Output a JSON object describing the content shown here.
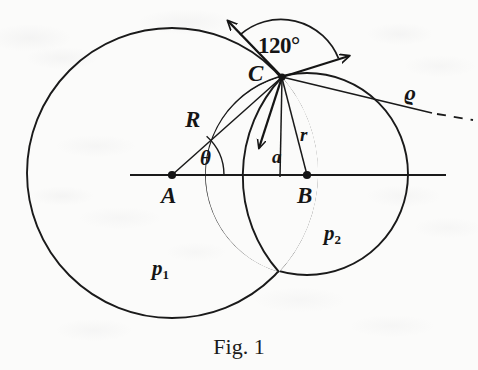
{
  "figure": {
    "caption": "Fig. 1",
    "domain_type": "geometry-diagram",
    "background_color": "#fbfbfa",
    "ink_color": "#151515"
  },
  "labels": {
    "angle": "120°",
    "point_a": "A",
    "point_b": "B",
    "point_c": "C",
    "radius_big": "R",
    "radius_small": "r",
    "theta": "θ",
    "offset_a": "a",
    "rho": "ϱ",
    "region_p1_base": "p",
    "region_p1_sub": "1",
    "region_p2_base": "p",
    "region_p2_sub": "2"
  },
  "geometry": {
    "circle_big": {
      "cx": 172,
      "cy": 173,
      "r": 145,
      "center_label": "A"
    },
    "circle_small": {
      "cx": 307,
      "cy": 174,
      "r": 101,
      "center_label": "B"
    },
    "intersection_top": {
      "x": 282,
      "y": 77,
      "label": "C"
    },
    "intersection_bottom": {
      "x": 279,
      "y": 272
    },
    "axis_line": {
      "x1": 130,
      "y1": 175,
      "x2": 446,
      "y2": 175
    },
    "arrow_upleft": {
      "x1": 282,
      "y1": 77,
      "x2": 225,
      "y2": 18
    },
    "arrow_upright": {
      "x1": 282,
      "y1": 77,
      "x2": 353,
      "y2": 55
    },
    "arrow_down": {
      "x1": 282,
      "y1": 77,
      "x2": 258,
      "y2": 152
    },
    "rho_line_solid": {
      "x1": 282,
      "y1": 77,
      "x2": 432,
      "y2": 113
    },
    "rho_line_dashed": {
      "x1": 436,
      "y1": 114,
      "x2": 472,
      "y2": 119
    },
    "segment_R": {
      "from": "A",
      "to": "C"
    },
    "segment_r": {
      "from": "B",
      "to": "C"
    },
    "segment_a": {
      "x1": 282,
      "y1": 77,
      "x2": 280,
      "y2": 176
    },
    "angle_arc_radius": 62,
    "theta_arc_radius": 52
  },
  "label_positions": {
    "angle": {
      "x": 258,
      "y": 34
    },
    "point_c": {
      "x": 248,
      "y": 62
    },
    "rho": {
      "x": 404,
      "y": 82
    },
    "radius_big": {
      "x": 185,
      "y": 108
    },
    "radius_small": {
      "x": 300,
      "y": 125
    },
    "theta": {
      "x": 200,
      "y": 148
    },
    "offset_a": {
      "x": 272,
      "y": 147
    },
    "point_a": {
      "x": 161,
      "y": 184
    },
    "point_b": {
      "x": 297,
      "y": 184
    },
    "region_p2": {
      "x": 324,
      "y": 223
    },
    "region_p1": {
      "x": 152,
      "y": 258
    },
    "caption": {
      "y": 334
    }
  }
}
